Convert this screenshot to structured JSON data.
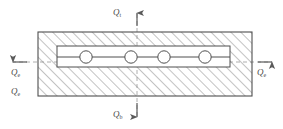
{
  "figure": {
    "type": "engineering-cross-section-diagram",
    "colors": {
      "line": "#555555",
      "hatch": "#777777",
      "axis": "#888888",
      "label": "#4a4a4a",
      "background": "#ffffff"
    },
    "body": {
      "outer_rect": {
        "x": 38,
        "y": 32,
        "width": 214,
        "height": 64
      },
      "inner_channel": {
        "x": 57,
        "y": 46,
        "width": 173,
        "height": 21
      },
      "hatch_angle_deg": 45,
      "circle_count": 4,
      "circle_radius": 6,
      "circle_centers_x": [
        86,
        131,
        164,
        205
      ],
      "circle_center_y": 57
    },
    "axes": {
      "vertical_x": 137,
      "horizontal_y": 62,
      "style": "dashed"
    }
  },
  "labels": {
    "top": {
      "symbol": "Q",
      "subscript": "t",
      "name": "top-heat-flux"
    },
    "bottom": {
      "symbol": "Q",
      "subscript": "b",
      "name": "bottom-heat-flux"
    },
    "left": {
      "symbol": "Q",
      "subscript": "e",
      "name": "left-edge-heat-flux"
    },
    "left_lower": {
      "symbol": "Q",
      "subscript": "e",
      "name": "lower-left-heat-flux"
    },
    "right": {
      "symbol": "Q",
      "subscript": "e",
      "name": "right-edge-heat-flux"
    }
  },
  "arrows": {
    "top": {
      "direction": "up"
    },
    "bottom": {
      "direction": "down"
    },
    "left": {
      "direction": "left"
    },
    "right": {
      "direction": "right"
    }
  }
}
